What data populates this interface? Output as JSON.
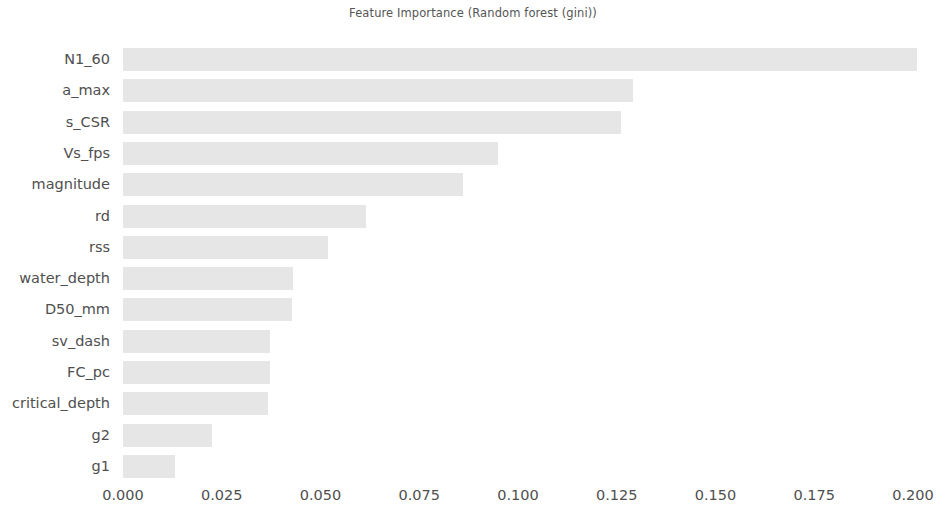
{
  "chart_data": {
    "type": "bar",
    "orientation": "horizontal",
    "title": "Feature Importance (Random forest (gini))",
    "xlabel": "",
    "ylabel": "",
    "categories": [
      "N1_60",
      "a_max",
      "s_CSR",
      "Vs_fps",
      "magnitude",
      "rd",
      "rss",
      "water_depth",
      "D50_mm",
      "sv_dash",
      "FC_pc",
      "critical_depth",
      "g2",
      "g1"
    ],
    "values": [
      0.201,
      0.129,
      0.126,
      0.095,
      0.086,
      0.0615,
      0.052,
      0.043,
      0.0428,
      0.0372,
      0.0372,
      0.0367,
      0.0225,
      0.0132
    ],
    "xlim": [
      0.0,
      0.2
    ],
    "xticks": [
      0.0,
      0.025,
      0.05,
      0.075,
      0.1,
      0.125,
      0.15,
      0.175,
      0.2
    ],
    "xtick_labels": [
      "0.000",
      "0.025",
      "0.050",
      "0.075",
      "0.100",
      "0.125",
      "0.150",
      "0.175",
      "0.200"
    ],
    "grid": false,
    "legend": null,
    "bar_color": "#e6e6e6",
    "text_color": "#4f4f4f",
    "background_color": "#ffffff"
  }
}
